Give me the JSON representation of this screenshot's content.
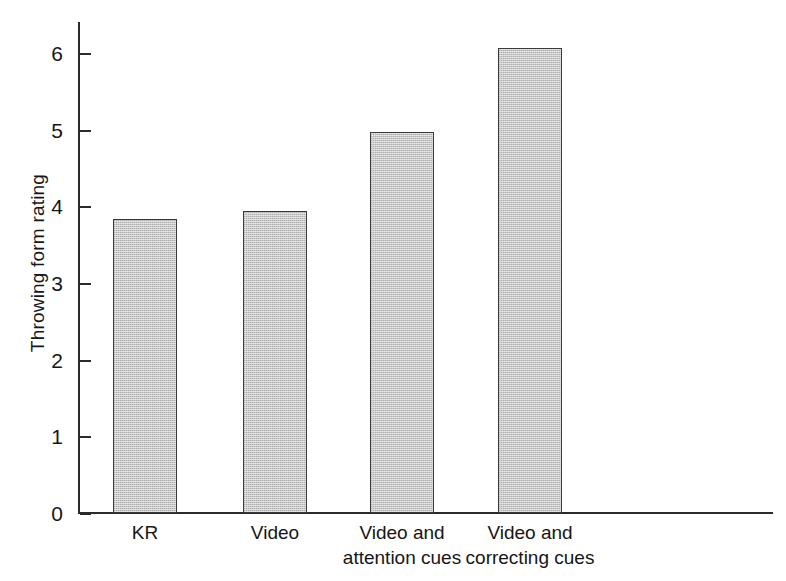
{
  "chart_data": {
    "type": "bar",
    "title": "",
    "subtitle": "",
    "xlabel": "",
    "ylabel": "Throwing form rating",
    "categories": [
      "KR",
      "Video",
      "Video and\nattention cues",
      "Video and\ncorrecting cues"
    ],
    "values": [
      3.83,
      3.94,
      4.97,
      6.06
    ],
    "ylim": [
      0,
      6.4
    ],
    "yticks": [
      0,
      1,
      2,
      3,
      4,
      5,
      6
    ],
    "ytick_labels": [
      "0",
      "1",
      "2",
      "3",
      "4",
      "5",
      "6"
    ],
    "grid": false,
    "legend": null,
    "bar_fill_color": "#cacaca",
    "bar_edge_color": "#3a3a3a",
    "axis_color": "#2b2b2b",
    "annotations": []
  },
  "figure": {
    "background_color": "#ffffff",
    "text_color": "#161616"
  }
}
